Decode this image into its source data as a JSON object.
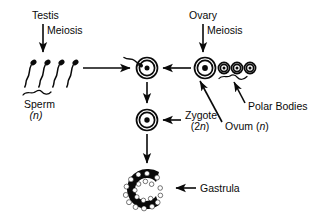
{
  "diagram": {
    "background_color": "#ffffff",
    "ink_color": "#0a0a0a",
    "labels": {
      "testis": "Testis",
      "meiosis_male": "Meiosis",
      "ovary": "Ovary",
      "meiosis_female": "Meiosis",
      "sperm": "Sperm",
      "sperm_ploidy": "(n)",
      "ovum": "Ovum (n)",
      "polar_bodies": "Polar Bodies",
      "zygote": "Zygote",
      "zygote_ploidy": "(2n)",
      "gastrula": "Gastrula"
    },
    "structures": [
      {
        "name": "sperm-cluster",
        "label": "Sperm",
        "ploidy": "n",
        "count": 4,
        "description": "four sperm cells with dark heads and wavy tails"
      },
      {
        "name": "fertilization-cell",
        "label": "",
        "description": "egg cell at moment of fertilization with sperm entering"
      },
      {
        "name": "ovum",
        "label": "Ovum",
        "ploidy": "n",
        "count": 1,
        "description": "large double-ringed cell with nucleus"
      },
      {
        "name": "polar-bodies",
        "label": "Polar Bodies",
        "count": 3,
        "description": "three small cells with nuclei"
      },
      {
        "name": "zygote",
        "label": "Zygote",
        "ploidy": "2n",
        "count": 1,
        "description": "double-ringed cell with nucleus"
      },
      {
        "name": "gastrula",
        "label": "Gastrula",
        "count": 1,
        "description": "C-shaped multicellular structure"
      }
    ],
    "arrows": [
      {
        "name": "testis-meiosis-arrow",
        "direction": "down",
        "from": "Testis / Meiosis",
        "to": "Sperm"
      },
      {
        "name": "ovary-meiosis-arrow",
        "direction": "down",
        "from": "Ovary / Meiosis",
        "to": "Ovum"
      },
      {
        "name": "sperm-to-fertilization-arrow",
        "direction": "right",
        "from": "Sperm",
        "to": "fertilization cell"
      },
      {
        "name": "ovum-to-fertilization-arrow",
        "direction": "left",
        "from": "Ovum",
        "to": "fertilization cell"
      },
      {
        "name": "fertilization-to-zygote-arrow",
        "direction": "down",
        "from": "fertilization cell",
        "to": "Zygote"
      },
      {
        "name": "zygote-to-gastrula-arrow",
        "direction": "down",
        "from": "Zygote",
        "to": "Gastrula"
      },
      {
        "name": "zygote-label-arrow",
        "direction": "left",
        "from": "Zygote label",
        "to": "Zygote"
      },
      {
        "name": "gastrula-label-arrow",
        "direction": "left",
        "from": "Gastrula label",
        "to": "Gastrula"
      },
      {
        "name": "ovum-label-arrow",
        "direction": "up-left",
        "from": "Ovum (n) label",
        "to": "Ovum"
      },
      {
        "name": "polar-bodies-label-arrow",
        "direction": "up-left",
        "from": "Polar Bodies label",
        "to": "polar bodies brace"
      }
    ]
  }
}
